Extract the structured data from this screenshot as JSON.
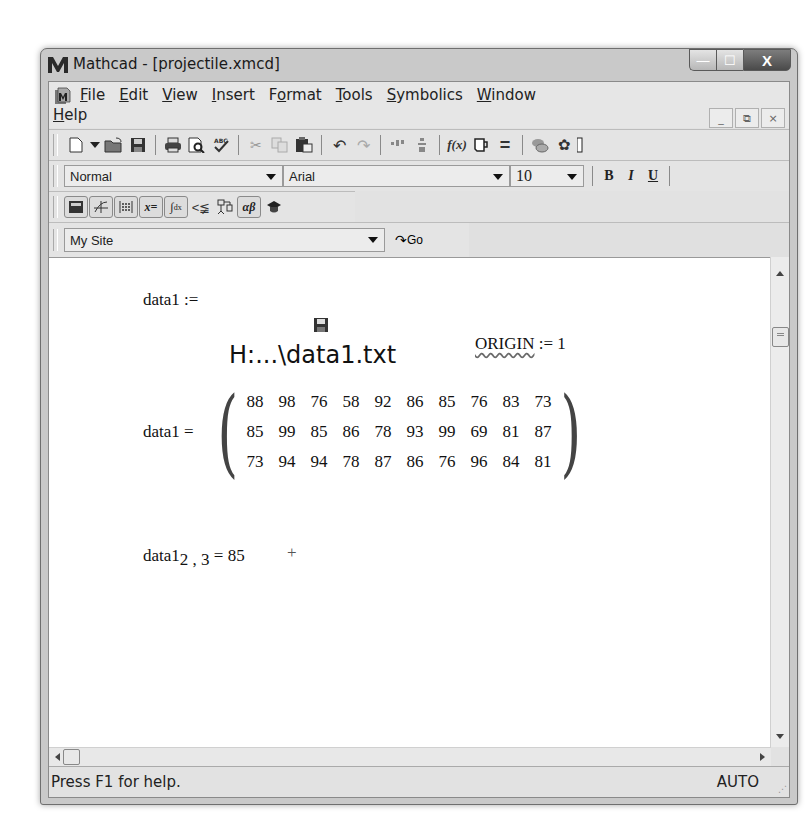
{
  "window": {
    "title": "Mathcad - [projectile.xmcd]",
    "controls": {
      "minimize": "—",
      "maximize": "☐",
      "close": "X"
    }
  },
  "menubar": {
    "items": [
      {
        "label": "File",
        "ul": "F",
        "rest": "ile"
      },
      {
        "label": "Edit",
        "ul": "E",
        "rest": "dit"
      },
      {
        "label": "View",
        "ul": "V",
        "rest": "iew"
      },
      {
        "label": "Insert",
        "ul": "I",
        "rest": "nsert"
      },
      {
        "label": "Format",
        "pre": "F",
        "ul": "o",
        "rest": "rmat"
      },
      {
        "label": "Tools",
        "ul": "T",
        "rest": "ools"
      },
      {
        "label": "Symbolics",
        "ul": "S",
        "rest": "ymbolics"
      },
      {
        "label": "Window",
        "ul": "W",
        "rest": "indow"
      },
      {
        "label": "Help",
        "ul": "H",
        "rest": "elp"
      }
    ],
    "mdi_controls": {
      "minimize": "_",
      "restore": "⧉",
      "close": "×"
    }
  },
  "standard_toolbar": {
    "icons": [
      "new-icon",
      "new-dropdown-icon",
      "open-icon",
      "save-icon",
      "print-icon",
      "print-preview-icon",
      "spell-check-icon",
      "cut-icon",
      "copy-icon",
      "paste-icon",
      "undo-icon",
      "redo-icon",
      "align-horizontal-icon",
      "align-vertical-icon",
      "insert-function-icon",
      "insert-unit-icon",
      "calculate-icon",
      "component-icon",
      "resource-icon"
    ]
  },
  "formatting_toolbar": {
    "style": "Normal",
    "font": "Arial",
    "size": "10",
    "bold": "B",
    "italic": "I",
    "underline": "U"
  },
  "math_toolbar": {
    "buttons": [
      {
        "name": "calculator-palette-icon",
        "glyph": "▦"
      },
      {
        "name": "graph-palette-icon",
        "glyph": "✢"
      },
      {
        "name": "matrix-palette-icon",
        "glyph": "⁝⁝"
      },
      {
        "name": "evaluation-palette-icon",
        "glyph": "x="
      },
      {
        "name": "calculus-palette-icon",
        "glyph": "∫"
      },
      {
        "name": "boolean-palette-icon",
        "glyph": "≤"
      },
      {
        "name": "programming-palette-icon",
        "glyph": "⊏"
      },
      {
        "name": "greek-palette-icon",
        "glyph": "αβ"
      },
      {
        "name": "symbolic-palette-icon",
        "glyph": "🎓"
      }
    ]
  },
  "web_toolbar": {
    "site": "My Site",
    "go_label": "Go"
  },
  "worksheet": {
    "assign_lhs": "data1 :=",
    "file_ref": "H:...\\data1.txt",
    "origin_lhs": "ORIGIN",
    "origin_rhs": ":= 1",
    "matrix_lhs": "data1 =",
    "matrix": [
      [
        "88",
        "98",
        "76",
        "58",
        "92",
        "86",
        "85",
        "76",
        "83",
        "73"
      ],
      [
        "85",
        "99",
        "85",
        "86",
        "78",
        "93",
        "99",
        "69",
        "81",
        "87"
      ],
      [
        "73",
        "94",
        "94",
        "78",
        "87",
        "86",
        "76",
        "96",
        "84",
        "81"
      ]
    ],
    "index_name": "data1",
    "index_sub": "2 , 3",
    "index_result": "= 85",
    "cursor": "+"
  },
  "statusbar": {
    "help": "Press F1 for help.",
    "mode": "AUTO"
  }
}
